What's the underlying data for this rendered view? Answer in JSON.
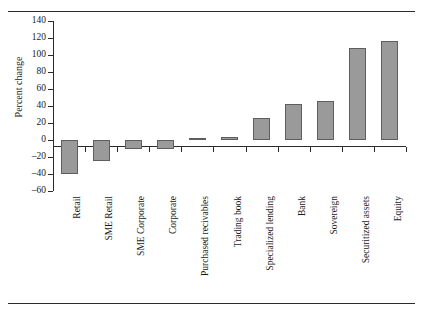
{
  "figure": {
    "ylabel": "Percent change",
    "top_fragment": ""
  },
  "chart_data": {
    "type": "bar",
    "title": "",
    "subtitle": "",
    "xlabel": "",
    "ylabel": "Percent change",
    "categories": [
      "Retail",
      "SME Retail",
      "SME Corporate",
      "Corporate",
      "Purchased recivables",
      "Trading book",
      "Specialized lending",
      "Bank",
      "Sovereign",
      "Securitized assets",
      "Equity"
    ],
    "values": [
      -40,
      -25,
      -11,
      -11,
      2,
      3,
      26,
      42,
      46,
      108,
      116
    ],
    "ylim": [
      -60,
      140
    ],
    "yticks": [
      -60,
      -40,
      -20,
      0,
      20,
      40,
      60,
      80,
      100,
      120,
      140
    ],
    "ytick_labels": [
      "–60",
      "–40",
      "–20",
      "0",
      "20",
      "40",
      "60",
      "80",
      "100",
      "120",
      "140"
    ],
    "grid": false,
    "legend": null,
    "bar_color": "#9a9a9a",
    "bar_edge_color": "#5e5e5e",
    "axis_color": "#2b2b2b"
  }
}
